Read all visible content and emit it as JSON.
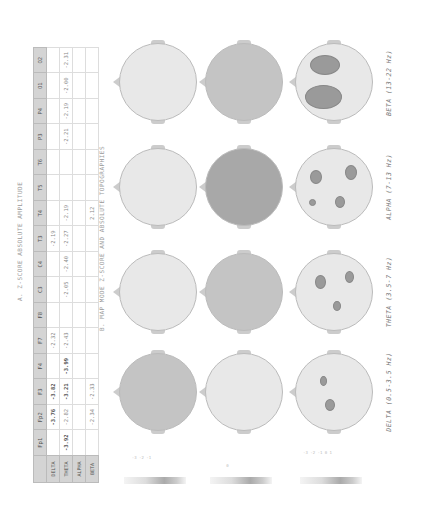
{
  "captions": {
    "table_title": "A. Z-SCORE ABSOLUTE AMPLITUDE",
    "maps_title": "B. MAP MODE Z-SCORE AND ABSOLUTE TOPOGRAPHIES"
  },
  "table": {
    "columns": [
      "Fp1",
      "Fp2",
      "F3",
      "F4",
      "F7",
      "F8",
      "C3",
      "C4",
      "T3",
      "T4",
      "T5",
      "T6",
      "P3",
      "P4",
      "O1",
      "O2"
    ],
    "rows": [
      {
        "label": "DELTA",
        "cells": [
          "",
          "-3.76",
          "-3.82",
          "",
          "-2.32",
          "",
          "",
          "",
          "-2.19",
          "",
          "",
          "",
          "",
          "",
          "",
          ""
        ]
      },
      {
        "label": "THETA",
        "cells": [
          "-3.92",
          "-2.82",
          "-3.21",
          "-3.99",
          "-2.43",
          "",
          "-2.05",
          "-2.40",
          "-2.27",
          "-2.19",
          "",
          "",
          "-2.21",
          "-2.19",
          "-2.00",
          "-2.31"
        ]
      },
      {
        "label": "ALPHA",
        "cells": [
          "",
          "",
          "",
          "",
          "",
          "",
          "",
          "",
          "",
          "",
          "",
          "",
          "",
          "",
          "",
          ""
        ]
      },
      {
        "label": "BETA",
        "cells": [
          "",
          "-2.34",
          "-2.33",
          "",
          "",
          "",
          "",
          "",
          "",
          "2.12",
          "",
          "",
          "",
          "",
          "",
          ""
        ]
      }
    ]
  },
  "bands": [
    {
      "key": "delta",
      "label": "DELTA (0.5-3.5 Hz)"
    },
    {
      "key": "theta",
      "label": "THETA (3.5-7 Hz)"
    },
    {
      "key": "alpha",
      "label": "ALPHA (7-13 Hz)"
    },
    {
      "key": "beta",
      "label": "BETA (13-22 Hz)"
    }
  ],
  "map_rows": [
    {
      "name": "z-score-map",
      "colorbar_ticks": "-3 -2 -1"
    },
    {
      "name": "absolute-map",
      "colorbar_ticks": "0"
    },
    {
      "name": "topography-map",
      "colorbar_ticks": "-3 -2 -1 0 1"
    }
  ],
  "colors": {
    "head_light": "#e8e8e8",
    "head_mid": "#c4c4c4",
    "head_dark": "#a8a8a8",
    "blob": "#9a9a9a"
  }
}
